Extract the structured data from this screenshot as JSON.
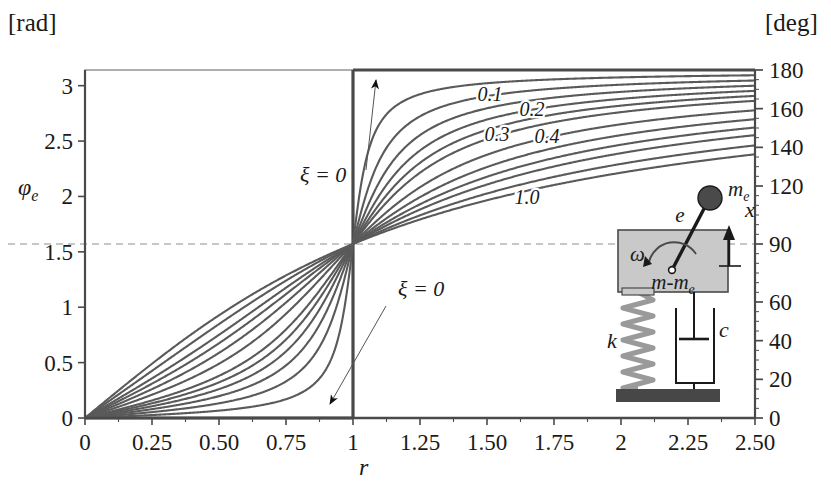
{
  "figure": {
    "left_unit": "[rad]",
    "right_unit": "[deg]",
    "y_axis_name": "φ",
    "y_axis_name_sub": "e",
    "x_axis_name": "r"
  },
  "annotations": [
    {
      "name": "xi-zero-upper",
      "text": "ξ = 0",
      "x": 300,
      "y": 182
    },
    {
      "name": "xi-zero-lower",
      "text": "ξ = 0",
      "x": 398,
      "y": 296
    }
  ],
  "inset": {
    "name": "rotating-unbalance-diagram",
    "labels": {
      "eccentric_mass": "m",
      "eccentric_mass_sub": "e",
      "eccentricity": "e",
      "displacement": "x",
      "angular_velocity": "ω",
      "body_mass": "m-m",
      "body_mass_sub": "e",
      "stiffness": "k",
      "damping": "c"
    },
    "colors": {
      "block_fill": "#c9c9c9",
      "block_stroke": "#4a4a4a",
      "ground_fill": "#474747",
      "mass_fill": "#4a4a4a",
      "spring_stroke": "#9a9a9a"
    }
  },
  "chart_data": {
    "type": "line",
    "title": "",
    "subtitle": "",
    "xlabel": "r",
    "ylabel": "φ_e",
    "ylabel_unit_left": "[rad]",
    "ylabel_unit_right": "[deg]",
    "grid": false,
    "legend": "inline-curve-labels",
    "xlim": [
      0,
      2.5
    ],
    "ylim": [
      0,
      3.14159
    ],
    "ylim_right": [
      0,
      180
    ],
    "xticks": [
      "0",
      "0.25",
      "0.50",
      "0.75",
      "1",
      "1.25",
      "1.50",
      "1.75",
      "2",
      "2.25",
      "2.50"
    ],
    "xtick_values": [
      0,
      0.25,
      0.5,
      0.75,
      1,
      1.25,
      1.5,
      1.75,
      2,
      2.25,
      2.5
    ],
    "yticks_left": [
      "0",
      "0.5",
      "1",
      "1.5",
      "2",
      "2.5",
      "3"
    ],
    "ytick_values_left": [
      0,
      0.5,
      1,
      1.5,
      2,
      2.5,
      3
    ],
    "yticks_right": [
      "0",
      "20",
      "40",
      "60",
      "90",
      "120",
      "140",
      "160",
      "180"
    ],
    "ytick_values_right": [
      0,
      20,
      40,
      60,
      90,
      120,
      140,
      160,
      180
    ],
    "reference_line": {
      "name": "pi-over-2-dashed",
      "y": 1.5708,
      "deg": 90,
      "style": "dashed"
    },
    "formula": "phi_e = atan2(2*xi*r, 1 - r^2)",
    "series": [
      {
        "name": "ξ = 0",
        "xi": 0,
        "label": "ξ = 0",
        "labeled": true,
        "label_x": null,
        "label_y": null
      },
      {
        "name": "ξ = 0.05",
        "xi": 0.05,
        "label": "",
        "labeled": false,
        "label_x": null,
        "label_y": null
      },
      {
        "name": "ξ = 0.1",
        "xi": 0.1,
        "label": "0.1",
        "labeled": true,
        "label_x": 490,
        "label_y": 101
      },
      {
        "name": "ξ = 0.15",
        "xi": 0.15,
        "label": "",
        "labeled": false,
        "label_x": null,
        "label_y": null
      },
      {
        "name": "ξ = 0.2",
        "xi": 0.2,
        "label": "0.2",
        "labeled": true,
        "label_x": 532,
        "label_y": 116
      },
      {
        "name": "ξ = 0.25",
        "xi": 0.25,
        "label": "",
        "labeled": false,
        "label_x": null,
        "label_y": null
      },
      {
        "name": "ξ = 0.3",
        "xi": 0.3,
        "label": "0.3",
        "labeled": true,
        "label_x": 497,
        "label_y": 141
      },
      {
        "name": "ξ = 0.4",
        "xi": 0.4,
        "label": "0.4",
        "labeled": true,
        "label_x": 547,
        "label_y": 143
      },
      {
        "name": "ξ = 0.5",
        "xi": 0.5,
        "label": "",
        "labeled": false,
        "label_x": null,
        "label_y": null
      },
      {
        "name": "ξ = 0.6",
        "xi": 0.6,
        "label": "",
        "labeled": false,
        "label_x": null,
        "label_y": null
      },
      {
        "name": "ξ = 0.7",
        "xi": 0.7,
        "label": "",
        "labeled": false,
        "label_x": null,
        "label_y": null
      },
      {
        "name": "ξ = 0.85",
        "xi": 0.85,
        "label": "",
        "labeled": false,
        "label_x": null,
        "label_y": null
      },
      {
        "name": "ξ = 1.0",
        "xi": 1.0,
        "label": "1.0",
        "labeled": true,
        "label_x": 527,
        "label_y": 204
      }
    ]
  },
  "plot_geometry": {
    "left": 85,
    "right": 755,
    "top": 70,
    "bottom": 418
  },
  "colors": {
    "curve": "#5a5a5a",
    "axis": "#4a4a4a",
    "frame": "#8d8d8d",
    "dashed": "#8d8d8d",
    "text": "#1a1a1a"
  }
}
